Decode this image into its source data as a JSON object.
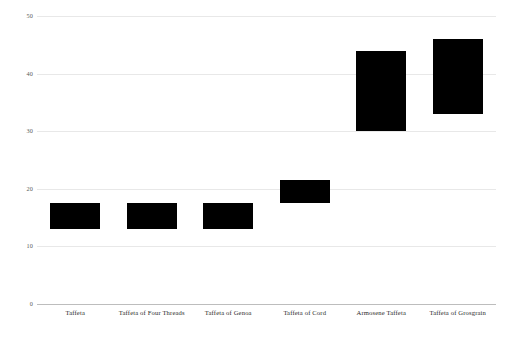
{
  "chart_data": {
    "type": "bar",
    "title": "",
    "subtitle": "",
    "xlabel": "",
    "ylabel": "",
    "ylim": [
      0,
      50
    ],
    "yticks": [
      "0",
      "10",
      "20",
      "30",
      "40",
      "50"
    ],
    "ytick_values": [
      0,
      10,
      20,
      30,
      40,
      50
    ],
    "grid": true,
    "legend": "none",
    "note": "floating / range bars: each bar spans from a low value to a high value",
    "categories": [
      "Taffeta",
      "Taffeta of Four Threads",
      "Taffeta of Genoa",
      "Taffeta of Cord",
      "Armosene Taffeta",
      "Taffeta of Grosgrain"
    ],
    "series": [
      {
        "name": "low",
        "values": [
          13,
          13,
          13,
          17.5,
          30,
          33
        ]
      },
      {
        "name": "high",
        "values": [
          17.5,
          17.5,
          17.5,
          21.5,
          44,
          46
        ]
      }
    ],
    "bar_color": "#000000",
    "grid_color": "#e8e8e8",
    "axis_color": "#bdbdbd"
  }
}
